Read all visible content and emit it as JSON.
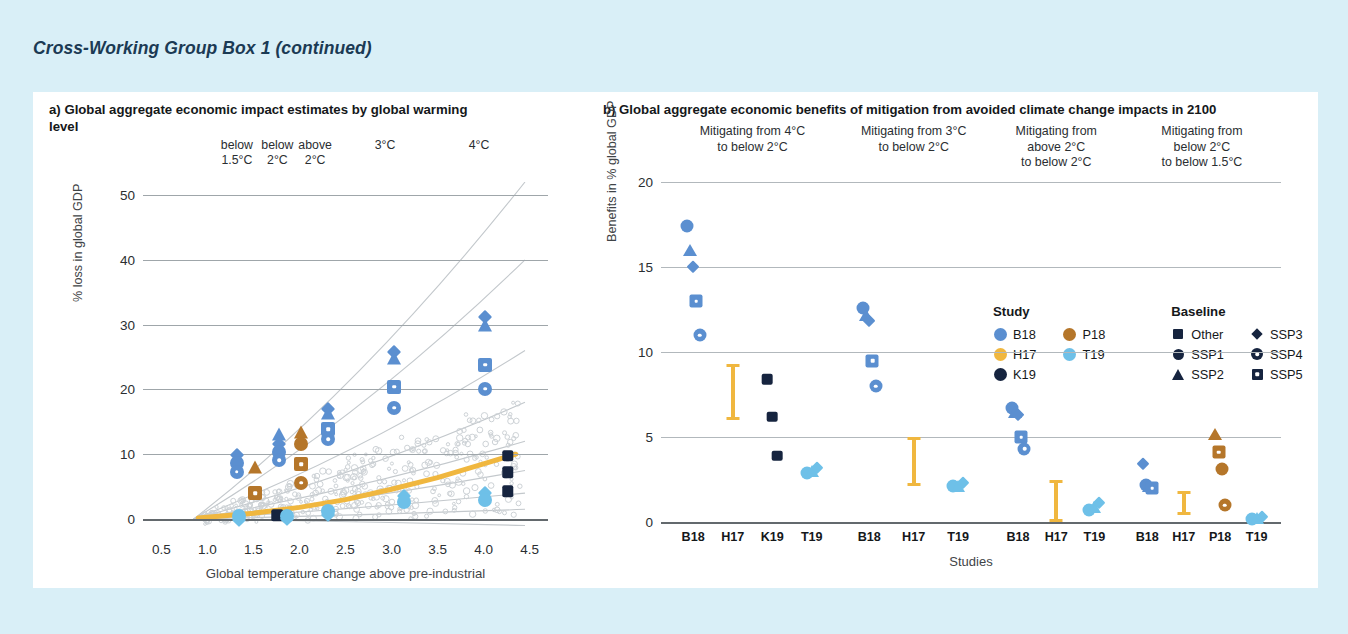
{
  "box": {
    "title": "Cross-Working Group Box 1 (continued)"
  },
  "colors": {
    "B18": "#5b8fd0",
    "H17": "#f0b73f",
    "K19": "#16243f",
    "P18": "#b5762a",
    "T19": "#6ec0e8",
    "background": "#d9eff7",
    "card": "#ffffff",
    "grid": "#9fa6aa",
    "axis": "#63696d",
    "title_color": "#1b3a54"
  },
  "panel_a": {
    "label": "a)",
    "title": "a) Global aggregate economic impact estimates by global warming level",
    "headers": [
      {
        "line1": "below",
        "line2": "1.5°C",
        "x": 1.32
      },
      {
        "line1": "below",
        "line2": "2°C",
        "x": 1.76
      },
      {
        "line1": "above",
        "line2": "2°C",
        "x": 2.17
      },
      {
        "line1": "3°C",
        "line2": "",
        "x": 2.93
      },
      {
        "line1": "4°C",
        "line2": "",
        "x": 3.95
      }
    ]
  },
  "panel_b": {
    "label": "b)",
    "title": "b) Global aggregate economic benefits of mitigation from avoided climate change impacts in 2100",
    "groups": [
      {
        "lines": [
          "Mitigating from 4°C",
          "to below 2°C"
        ]
      },
      {
        "lines": [
          "Mitigating from 3°C",
          "to below 2°C"
        ]
      },
      {
        "lines": [
          "Mitigating from",
          "above 2°C",
          "to below 2°C"
        ]
      },
      {
        "lines": [
          "Mitigating from",
          "below 2°C",
          "to below 1.5°C"
        ]
      }
    ],
    "legend": {
      "study_heading": "Study",
      "baseline_heading": "Baseline",
      "studies": [
        {
          "label": "B18",
          "color": "#5b8fd0"
        },
        {
          "label": "H17",
          "color": "#f0b73f"
        },
        {
          "label": "K19",
          "color": "#16243f"
        },
        {
          "label": "P18",
          "color": "#b5762a"
        },
        {
          "label": "T19",
          "color": "#6ec0e8"
        }
      ],
      "baselines": [
        {
          "label": "Other",
          "shape": "square"
        },
        {
          "label": "SSP1",
          "shape": "circle"
        },
        {
          "label": "SSP2",
          "shape": "triangle"
        },
        {
          "label": "SSP3",
          "shape": "diamond"
        },
        {
          "label": "SSP4",
          "shape": "circle-dot"
        },
        {
          "label": "SSP5",
          "shape": "square-dot"
        }
      ]
    }
  },
  "footnote": "P18: Pretis et al. (2018), B18: Burke et al. (2018), K19: Khan et al. (2019), T19: Takakura et al. (2019), H17: Howard & Sterner (2017)",
  "chart_data": [
    {
      "type": "scatter",
      "id": "panel-a",
      "title": "a) Global aggregate economic impact estimates by global warming level",
      "xlabel": "Global temperature change above pre-industrial",
      "ylabel": "% loss in global GDP",
      "xlim": [
        0.3,
        4.7
      ],
      "ylim": [
        -2,
        52
      ],
      "xticks": [
        "0.5",
        "1.0",
        "1.5",
        "2.0",
        "2.5",
        "3.0",
        "3.5",
        "4.0",
        "4.5"
      ],
      "xtickvals": [
        0.5,
        1.0,
        1.5,
        2.0,
        2.5,
        3.0,
        3.5,
        4.0,
        4.5
      ],
      "yticks": [
        "0",
        "10",
        "20",
        "30",
        "40",
        "50"
      ],
      "ytickvals": [
        0,
        10,
        20,
        30,
        40,
        50
      ],
      "grid": true,
      "legend": "none",
      "points": [
        {
          "study": "B18",
          "baseline": "SSP3",
          "x": 1.32,
          "y": 9.9
        },
        {
          "study": "B18",
          "baseline": "SSP1",
          "x": 1.32,
          "y": 8.6
        },
        {
          "study": "B18",
          "baseline": "SSP4",
          "x": 1.32,
          "y": 7.3
        },
        {
          "study": "P18",
          "baseline": "SSP2",
          "x": 1.52,
          "y": 8.0
        },
        {
          "study": "P18",
          "baseline": "SSP5",
          "x": 1.52,
          "y": 4.0
        },
        {
          "study": "T19",
          "baseline": "SSP1",
          "x": 1.34,
          "y": 0.4
        },
        {
          "study": "T19",
          "baseline": "SSP3",
          "x": 1.34,
          "y": -0.2
        },
        {
          "study": "B18",
          "baseline": "SSP2",
          "x": 1.78,
          "y": 13.1
        },
        {
          "study": "B18",
          "baseline": "SSP3",
          "x": 1.78,
          "y": 11.6
        },
        {
          "study": "B18",
          "baseline": "SSP1",
          "x": 1.78,
          "y": 10.3
        },
        {
          "study": "B18",
          "baseline": "SSP4",
          "x": 1.78,
          "y": 9.1
        },
        {
          "study": "K19",
          "baseline": "Other",
          "x": 1.76,
          "y": 0.6
        },
        {
          "study": "P18",
          "baseline": "SSP2",
          "x": 2.02,
          "y": 13.4
        },
        {
          "study": "P18",
          "baseline": "SSP1",
          "x": 2.02,
          "y": 11.6
        },
        {
          "study": "P18",
          "baseline": "SSP5",
          "x": 2.02,
          "y": 8.5
        },
        {
          "study": "P18",
          "baseline": "SSP4",
          "x": 2.02,
          "y": 5.6
        },
        {
          "study": "T19",
          "baseline": "SSP1",
          "x": 1.86,
          "y": 0.5
        },
        {
          "study": "T19",
          "baseline": "SSP3",
          "x": 1.86,
          "y": 0.0
        },
        {
          "study": "B18",
          "baseline": "SSP3",
          "x": 2.31,
          "y": 17.0
        },
        {
          "study": "B18",
          "baseline": "SSP2",
          "x": 2.31,
          "y": 16.3
        },
        {
          "study": "B18",
          "baseline": "SSP5",
          "x": 2.31,
          "y": 13.9
        },
        {
          "study": "B18",
          "baseline": "SSP4",
          "x": 2.31,
          "y": 12.3
        },
        {
          "study": "T19",
          "baseline": "SSP1",
          "x": 2.31,
          "y": 1.2
        },
        {
          "study": "T19",
          "baseline": "SSP3",
          "x": 2.31,
          "y": 0.6
        },
        {
          "study": "B18",
          "baseline": "SSP3",
          "x": 3.03,
          "y": 25.7
        },
        {
          "study": "B18",
          "baseline": "SSP2",
          "x": 3.03,
          "y": 24.8
        },
        {
          "study": "B18",
          "baseline": "SSP5",
          "x": 3.03,
          "y": 20.4
        },
        {
          "study": "B18",
          "baseline": "SSP4",
          "x": 3.03,
          "y": 17.2
        },
        {
          "study": "T19",
          "baseline": "SSP3",
          "x": 3.14,
          "y": 3.6
        },
        {
          "study": "T19",
          "baseline": "SSP1",
          "x": 3.14,
          "y": 2.6
        },
        {
          "study": "B18",
          "baseline": "SSP3",
          "x": 4.02,
          "y": 31.1
        },
        {
          "study": "B18",
          "baseline": "SSP2",
          "x": 4.02,
          "y": 29.9
        },
        {
          "study": "B18",
          "baseline": "SSP5",
          "x": 4.02,
          "y": 23.8
        },
        {
          "study": "B18",
          "baseline": "SSP4",
          "x": 4.02,
          "y": 20.1
        },
        {
          "study": "T19",
          "baseline": "SSP3",
          "x": 4.02,
          "y": 4.0
        },
        {
          "study": "T19",
          "baseline": "SSP1",
          "x": 4.02,
          "y": 3.0
        },
        {
          "study": "K19",
          "baseline": "Other",
          "x": 4.26,
          "y": 9.8
        },
        {
          "study": "K19",
          "baseline": "Other",
          "x": 4.26,
          "y": 7.2
        },
        {
          "study": "K19",
          "baseline": "Other",
          "x": 4.26,
          "y": 4.3
        }
      ],
      "h17_band": {
        "study": "H17",
        "description": "Howard & Sterner (2017) damage function shown as thick gold curve",
        "curve": [
          [
            0.9,
            0.15
          ],
          [
            1.5,
            0.9
          ],
          [
            2.0,
            1.8
          ],
          [
            2.5,
            3.0
          ],
          [
            3.0,
            4.6
          ],
          [
            3.5,
            6.4
          ],
          [
            4.0,
            8.5
          ],
          [
            4.35,
            10.0
          ]
        ]
      }
    },
    {
      "type": "scatter",
      "id": "panel-b",
      "title": "b) Global aggregate economic benefits of mitigation from avoided climate change impacts in 2100",
      "xlabel": "Studies",
      "ylabel": "Benefits in % global GDP",
      "ylim": [
        0,
        20
      ],
      "yticks": [
        "0",
        "5",
        "10",
        "15",
        "20"
      ],
      "ytickvals": [
        0,
        5,
        10,
        15,
        20
      ],
      "grid": true,
      "groups": [
        {
          "name": "Mitigating from 4°C to below 2°C",
          "studies": [
            {
              "label": "B18",
              "points": [
                {
                  "baseline": "SSP1",
                  "y": 17.4
                },
                {
                  "baseline": "SSP2",
                  "y": 16.0
                },
                {
                  "baseline": "SSP3",
                  "y": 15.0
                },
                {
                  "baseline": "SSP5",
                  "y": 13.0
                },
                {
                  "baseline": "SSP4",
                  "y": 11.0
                }
              ]
            },
            {
              "label": "H17",
              "range": [
                6.0,
                9.3
              ]
            },
            {
              "label": "K19",
              "points": [
                {
                  "baseline": "Other",
                  "y": 8.4
                },
                {
                  "baseline": "Other",
                  "y": 6.2
                },
                {
                  "baseline": "Other",
                  "y": 3.9
                }
              ]
            },
            {
              "label": "T19",
              "points": [
                {
                  "baseline": "SSP1",
                  "y": 2.9
                },
                {
                  "baseline": "SSP2",
                  "y": 3.0
                },
                {
                  "baseline": "SSP3",
                  "y": 3.2
                }
              ]
            }
          ]
        },
        {
          "name": "Mitigating from 3°C to below 2°C",
          "studies": [
            {
              "label": "B18",
              "points": [
                {
                  "baseline": "SSP1",
                  "y": 12.6
                },
                {
                  "baseline": "SSP2",
                  "y": 12.2
                },
                {
                  "baseline": "SSP3",
                  "y": 11.8
                },
                {
                  "baseline": "SSP5",
                  "y": 9.5
                },
                {
                  "baseline": "SSP4",
                  "y": 8.0
                }
              ]
            },
            {
              "label": "H17",
              "range": [
                2.1,
                5.0
              ]
            },
            {
              "label": "T19",
              "points": [
                {
                  "baseline": "SSP1",
                  "y": 2.1
                },
                {
                  "baseline": "SSP2",
                  "y": 2.1
                },
                {
                  "baseline": "SSP3",
                  "y": 2.3
                }
              ]
            }
          ]
        },
        {
          "name": "Mitigating from above 2°C to below 2°C",
          "studies": [
            {
              "label": "B18",
              "points": [
                {
                  "baseline": "SSP1",
                  "y": 6.7
                },
                {
                  "baseline": "SSP2",
                  "y": 6.5
                },
                {
                  "baseline": "SSP3",
                  "y": 6.3
                },
                {
                  "baseline": "SSP5",
                  "y": 5.0
                },
                {
                  "baseline": "SSP4",
                  "y": 4.3
                }
              ]
            },
            {
              "label": "H17",
              "range": [
                0.0,
                2.5
              ]
            },
            {
              "label": "T19",
              "points": [
                {
                  "baseline": "SSP1",
                  "y": 0.7
                },
                {
                  "baseline": "SSP2",
                  "y": 0.9
                },
                {
                  "baseline": "SSP3",
                  "y": 1.1
                }
              ]
            }
          ]
        },
        {
          "name": "Mitigating from below 2°C to below 1.5°C",
          "studies": [
            {
              "label": "B18",
              "points": [
                {
                  "baseline": "SSP3",
                  "y": 3.4
                },
                {
                  "baseline": "SSP1",
                  "y": 2.2
                },
                {
                  "baseline": "SSP2",
                  "y": 2.1
                },
                {
                  "baseline": "SSP5",
                  "y": 2.0
                }
              ]
            },
            {
              "label": "H17",
              "range": [
                0.4,
                1.8
              ]
            },
            {
              "label": "P18",
              "points": [
                {
                  "baseline": "SSP2",
                  "y": 5.2
                },
                {
                  "baseline": "SSP5",
                  "y": 4.1
                },
                {
                  "baseline": "SSP1",
                  "y": 3.1
                },
                {
                  "baseline": "SSP4",
                  "y": 1.0
                }
              ]
            },
            {
              "label": "T19",
              "points": [
                {
                  "baseline": "SSP1",
                  "y": 0.2
                },
                {
                  "baseline": "SSP2",
                  "y": 0.25
                },
                {
                  "baseline": "SSP3",
                  "y": 0.3
                }
              ]
            }
          ]
        }
      ]
    }
  ]
}
